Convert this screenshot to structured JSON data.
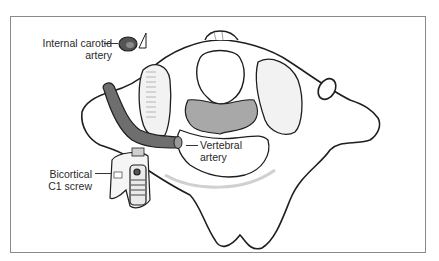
{
  "figure": {
    "labels": {
      "internal_carotid": {
        "line1": "Internal carotid",
        "line2": "artery"
      },
      "vertebral": {
        "line1": "Vertebral",
        "line2": "artery"
      },
      "screw": {
        "line1": "Bicortical",
        "line2": "C1 screw"
      }
    },
    "colors": {
      "bone_fill": "#ffffff",
      "bone_shade": "#d9d9d9",
      "canal_fill": "#a8a8a8",
      "artery_fill": "#6e6e6e",
      "outline": "#1e1e1e",
      "frame": "#8a8a8a"
    }
  }
}
